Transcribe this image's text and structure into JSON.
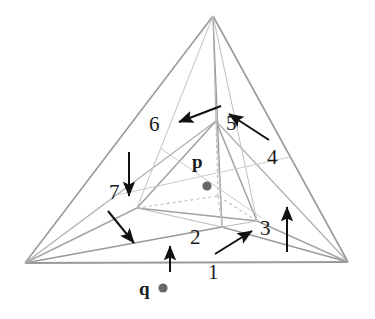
{
  "figure": {
    "background_color": "#ffffff",
    "line_color": "#8a8a8a",
    "hidden_line_color": "#b5b5b5",
    "arrow_color": "#111111",
    "text_color": "#1a1a1a",
    "point_color": "#686868"
  },
  "points": [
    {
      "name": "p",
      "label": "p",
      "label_x": 192,
      "label_y": 160,
      "dot_x": 207,
      "dot_y": 186,
      "dot_r": 4.6,
      "description": "query point inside the tetrahedron"
    },
    {
      "name": "q",
      "label": "q",
      "label_x": 139,
      "label_y": 272,
      "dot_x": 163,
      "dot_y": 288,
      "dot_r": 4.6,
      "description": "query point below the base of the tetrahedron"
    }
  ],
  "region_labels": [
    {
      "id": "region-1",
      "text": "1",
      "x": 208,
      "y": 272
    },
    {
      "id": "region-2",
      "text": "2",
      "x": 190,
      "y": 237
    },
    {
      "id": "region-3",
      "text": "3",
      "x": 260,
      "y": 228
    },
    {
      "id": "region-4",
      "text": "4",
      "x": 267,
      "y": 157
    },
    {
      "id": "region-5",
      "text": "5",
      "x": 226,
      "y": 123
    },
    {
      "id": "region-6",
      "text": "6",
      "x": 149,
      "y": 124
    },
    {
      "id": "region-7",
      "text": "7",
      "x": 109,
      "y": 192
    }
  ],
  "arrows": [
    {
      "id": "arrow-1",
      "from_x": 170,
      "from_y": 272,
      "to_x": 170,
      "to_y": 244,
      "points_to": "1"
    },
    {
      "id": "arrow-2",
      "from_x": 215,
      "from_y": 254,
      "to_x": 254,
      "to_y": 230,
      "points_to": "3"
    },
    {
      "id": "arrow-3",
      "from_x": 287,
      "from_y": 252,
      "to_x": 287,
      "to_y": 205,
      "points_to": "4"
    },
    {
      "id": "arrow-4",
      "from_x": 269,
      "from_y": 140,
      "to_x": 227,
      "to_y": 112,
      "points_to": "5"
    },
    {
      "id": "arrow-5",
      "from_x": 221,
      "from_y": 106,
      "to_x": 177,
      "to_y": 123,
      "points_to": "6"
    },
    {
      "id": "arrow-6",
      "from_x": 129,
      "from_y": 152,
      "to_x": 129,
      "to_y": 198,
      "points_to": "7"
    },
    {
      "id": "arrow-7",
      "from_x": 108,
      "from_y": 211,
      "to_x": 136,
      "to_y": 245,
      "points_to": "7-lower"
    }
  ],
  "geometry": {
    "outer_vertices": {
      "apex": [
        213,
        16
      ],
      "bottom_left": [
        25,
        263
      ],
      "bottom_right": [
        348,
        262
      ],
      "back": [
        222,
        227
      ]
    },
    "inner_vertices": {
      "top": [
        216,
        121
      ],
      "left": [
        137,
        208
      ],
      "right": [
        257,
        221
      ],
      "back": [
        218,
        196
      ]
    }
  }
}
